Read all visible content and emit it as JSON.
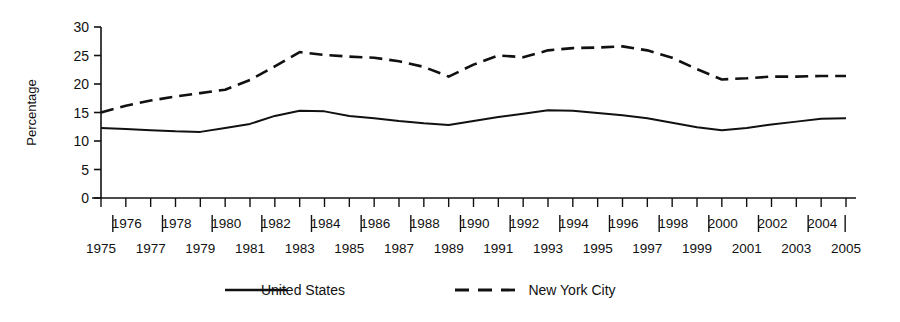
{
  "chart_data": {
    "type": "line",
    "title": "",
    "subtitle": "",
    "xlabel": "",
    "ylabel": "Percentage",
    "ylim": [
      0,
      30
    ],
    "yticks": [
      0,
      5,
      10,
      15,
      20,
      25,
      30
    ],
    "ytick_labels": [
      "0",
      "5",
      "10",
      "15",
      "20",
      "25",
      "30"
    ],
    "grid": false,
    "legend_position": "bottom",
    "x": [
      1975,
      1976,
      1977,
      1978,
      1979,
      1980,
      1981,
      1982,
      1983,
      1984,
      1985,
      1986,
      1987,
      1988,
      1989,
      1990,
      1991,
      1992,
      1993,
      1994,
      1995,
      1996,
      1997,
      1998,
      1999,
      2000,
      2001,
      2002,
      2003,
      2004,
      2005
    ],
    "xtick_labels_upper": [
      "",
      "1976",
      "",
      "1978",
      "",
      "1980",
      "",
      "1982",
      "",
      "1984",
      "",
      "1986",
      "",
      "1988",
      "",
      "1990",
      "",
      "1992",
      "",
      "1994",
      "",
      "1996",
      "",
      "1998",
      "",
      "2000",
      "",
      "2002",
      "",
      "2004",
      ""
    ],
    "xtick_labels_lower": [
      "1975",
      "",
      "1977",
      "",
      "1979",
      "",
      "1981",
      "",
      "1983",
      "",
      "1985",
      "",
      "1987",
      "",
      "1989",
      "",
      "1991",
      "",
      "1993",
      "",
      "1995",
      "",
      "1997",
      "",
      "1999",
      "",
      "2001",
      "",
      "2003",
      "",
      "2005"
    ],
    "series": [
      {
        "name": "United States",
        "style": "solid",
        "color": "#111111",
        "values": [
          12.3,
          12.1,
          11.9,
          11.7,
          11.6,
          12.3,
          13.0,
          14.4,
          15.3,
          15.2,
          14.4,
          14.0,
          13.5,
          13.1,
          12.8,
          13.5,
          14.2,
          14.8,
          15.4,
          15.3,
          14.9,
          14.5,
          14.0,
          13.2,
          12.4,
          11.9,
          12.3,
          12.9,
          13.4,
          13.9,
          14.0
        ]
      },
      {
        "name": "New York City",
        "style": "dashed",
        "color": "#111111",
        "values": [
          15.0,
          16.2,
          17.1,
          17.8,
          18.4,
          19.0,
          20.7,
          23.1,
          25.6,
          25.1,
          24.8,
          24.6,
          24.0,
          23.0,
          21.3,
          23.4,
          25.0,
          24.7,
          25.9,
          26.3,
          26.4,
          26.6,
          25.9,
          24.6,
          22.6,
          20.8,
          21.0,
          21.3,
          21.3,
          21.4,
          21.4
        ]
      }
    ]
  },
  "legend": {
    "items": [
      {
        "label": "United States",
        "style": "solid"
      },
      {
        "label": "New York City",
        "style": "dashed"
      }
    ]
  },
  "axis": {
    "y_title": "Percentage"
  }
}
